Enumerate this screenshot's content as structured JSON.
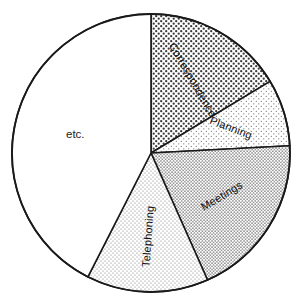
{
  "chart_data": {
    "type": "pie",
    "title": "",
    "subtitle": "",
    "xlabel": "",
    "ylabel": "",
    "legend_position": "none",
    "grid": false,
    "labels_inside_slices": true,
    "start_angle_deg": 0,
    "direction": "clockwise",
    "categories": [
      "Correspondence",
      "Planning",
      "Meetings",
      "Telephoning",
      "etc."
    ],
    "values": [
      16.4,
      7.8,
      19.2,
      14.2,
      42.4
    ],
    "units": "percent",
    "slices": [
      {
        "label": "Correspondence",
        "value": 16.4,
        "start_angle_deg": 0,
        "end_angle_deg": 59,
        "fill_pattern": "dense-dots",
        "fill_color": "#ffffff",
        "pattern_color": "#3a3a3a",
        "label_rotation_deg": 60,
        "label_orientation": "radial"
      },
      {
        "label": "Planning",
        "value": 7.8,
        "start_angle_deg": 59,
        "end_angle_deg": 87,
        "fill_pattern": "sparse-dots",
        "fill_color": "#ffffff",
        "pattern_color": "#6a6a6a",
        "label_rotation_deg": 21,
        "label_orientation": "radial"
      },
      {
        "label": "Meetings",
        "value": 19.2,
        "start_angle_deg": 87,
        "end_angle_deg": 156,
        "fill_pattern": "medium-dots",
        "fill_color": "#ffffff",
        "pattern_color": "#5a5a5a",
        "label_rotation_deg": -31,
        "label_orientation": "radial"
      },
      {
        "label": "Telephoning",
        "value": 14.2,
        "start_angle_deg": 156,
        "end_angle_deg": 207,
        "fill_pattern": "light-dots",
        "fill_color": "#ffffff",
        "pattern_color": "#707070",
        "label_rotation_deg": -86,
        "label_orientation": "radial"
      },
      {
        "label": "etc.",
        "value": 42.4,
        "start_angle_deg": 207,
        "end_angle_deg": 360,
        "fill_pattern": "none",
        "fill_color": "#ffffff",
        "pattern_color": "#ffffff",
        "label_rotation_deg": 0,
        "label_orientation": "horizontal"
      }
    ],
    "geometry": {
      "center_x": 151,
      "center_y": 153,
      "radius": 139
    }
  },
  "labels": {
    "correspondence": "Correspondence",
    "planning": "Planning",
    "meetings": "Meetings",
    "telephoning": "Telephoning",
    "etc": "etc."
  },
  "colors": {
    "outline": "#1a1a1a",
    "background": "#ffffff",
    "text": "#111111"
  }
}
